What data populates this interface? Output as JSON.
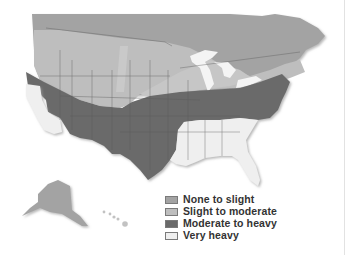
{
  "map": {
    "region": "United States and southern Canada",
    "colors": {
      "none_to_slight": "#a3a3a3",
      "slight_to_moderate": "#bebebe",
      "moderate_to_heavy": "#6a6a6a",
      "very_heavy": "#eeeeee",
      "water_lakes": "#f4f4f4",
      "borders": "#555555"
    }
  },
  "legend": {
    "items": [
      {
        "label": "None to slight",
        "color": "#a3a3a3"
      },
      {
        "label": "Slight to moderate",
        "color": "#bebebe"
      },
      {
        "label": "Moderate to heavy",
        "color": "#6a6a6a"
      },
      {
        "label": "Very heavy",
        "color": "#efefef"
      }
    ]
  }
}
